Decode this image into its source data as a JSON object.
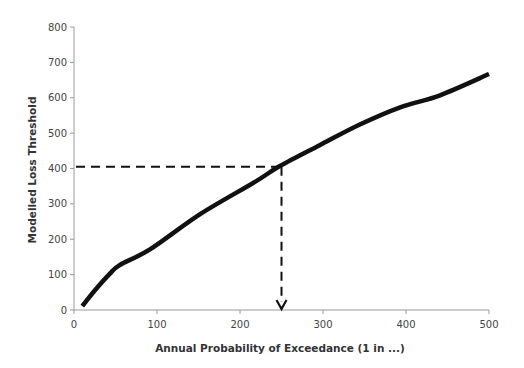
{
  "chart_data": {
    "type": "line",
    "title": "",
    "xlabel": "Annual Probability of Exceedance (1 in ...)",
    "ylabel": "Modelled Loss Threshold",
    "xlim": [
      0,
      500
    ],
    "ylim": [
      0,
      800
    ],
    "x_ticks": [
      0,
      100,
      200,
      300,
      400,
      500
    ],
    "y_ticks": [
      0,
      100,
      200,
      300,
      400,
      500,
      600,
      700,
      800
    ],
    "grid": false,
    "legend": null,
    "series": [
      {
        "name": "Loss curve",
        "color": "#111111",
        "x": [
          10,
          25,
          43,
          55,
          92,
          152,
          218,
          248,
          296,
          345,
          393,
          441,
          500
        ],
        "values": [
          11,
          55,
          102,
          127,
          172,
          271,
          362,
          407,
          466,
          525,
          573,
          607,
          667
        ]
      }
    ],
    "annotations": [
      {
        "type": "dashed-horizontal-line",
        "from_x": 0,
        "to_x": 250,
        "y": 405
      },
      {
        "type": "dashed-vertical-arrow",
        "x": 250,
        "from_y": 405,
        "to_y": 0
      }
    ]
  }
}
